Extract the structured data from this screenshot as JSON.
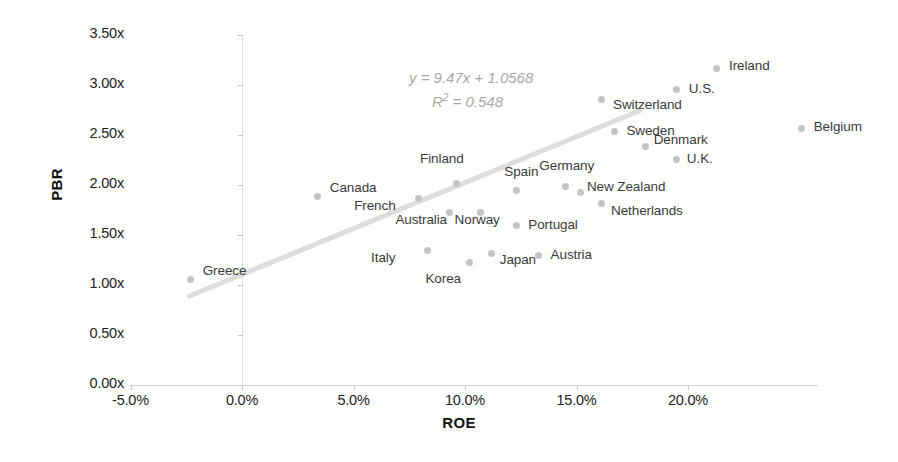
{
  "chart_data": {
    "type": "scatter",
    "title": "",
    "xlabel": "ROE",
    "ylabel": "PBR",
    "xlim": [
      -5.0,
      20.0
    ],
    "ylim": [
      0.0,
      3.5
    ],
    "x_tick_labels": [
      "-5.0%",
      "0.0%",
      "5.0%",
      "10.0%",
      "15.0%",
      "20.0%"
    ],
    "x_ticks": [
      -5.0,
      0.0,
      5.0,
      10.0,
      15.0,
      20.0
    ],
    "y_tick_labels": [
      "0.00x",
      "0.50x",
      "1.00x",
      "1.50x",
      "2.00x",
      "2.50x",
      "3.00x",
      "3.50x"
    ],
    "y_ticks": [
      0.0,
      0.5,
      1.0,
      1.5,
      2.0,
      2.5,
      3.0,
      3.5
    ],
    "grid": false,
    "legend": "none",
    "marker_color": "#c4c4c4",
    "trendline_color": "#dcdcdc",
    "annotations": {
      "equation": "y = 9.47x + 1.0568",
      "r_squared_prefix": "R",
      "r_squared_sup": "2",
      "r_squared_value": " = 0.548",
      "color": "#a8a8a8"
    },
    "trendline": {
      "x_start": -2.35,
      "y_start": 0.89,
      "x_end": 17.8,
      "y_end": 2.74
    },
    "points": [
      {
        "label": "Greece",
        "x": -2.3,
        "y": 1.06,
        "label_dx": 12,
        "label_dy": -8
      },
      {
        "label": "Canada",
        "x": 3.4,
        "y": 1.89,
        "label_dx": 12,
        "label_dy": -8
      },
      {
        "label": "French",
        "x": 7.9,
        "y": 1.87,
        "label_dx": -64,
        "label_dy": 8
      },
      {
        "label": "Finland",
        "x": 9.6,
        "y": 2.02,
        "label_dx": -36,
        "label_dy": -24
      },
      {
        "label": "Australia",
        "x": 9.3,
        "y": 1.73,
        "label_dx": -54,
        "label_dy": 8
      },
      {
        "label": "Italy",
        "x": 8.3,
        "y": 1.35,
        "label_dx": -56,
        "label_dy": 8
      },
      {
        "label": "Korea",
        "x": 10.2,
        "y": 1.23,
        "label_dx": -44,
        "label_dy": 17
      },
      {
        "label": "Norway",
        "x": 10.7,
        "y": 1.73,
        "label_dx": -26,
        "label_dy": 8
      },
      {
        "label": "Japan",
        "x": 11.2,
        "y": 1.32,
        "label_dx": 8,
        "label_dy": 7
      },
      {
        "label": "Spain",
        "x": 12.3,
        "y": 1.95,
        "label_dx": -12,
        "label_dy": -18
      },
      {
        "label": "Portugal",
        "x": 12.3,
        "y": 1.6,
        "label_dx": 12,
        "label_dy": 0
      },
      {
        "label": "Austria",
        "x": 13.3,
        "y": 1.3,
        "label_dx": 12,
        "label_dy": 0
      },
      {
        "label": "Germany",
        "x": 14.5,
        "y": 1.99,
        "label_dx": -26,
        "label_dy": -20
      },
      {
        "label": "New Zealand",
        "x": 15.2,
        "y": 1.93,
        "label_dx": 6,
        "label_dy": -5
      },
      {
        "label": "Netherlands",
        "x": 16.1,
        "y": 1.82,
        "label_dx": 10,
        "label_dy": 8
      },
      {
        "label": "Switzerland",
        "x": 16.1,
        "y": 2.86,
        "label_dx": 12,
        "label_dy": 6
      },
      {
        "label": "Sweden",
        "x": 16.7,
        "y": 2.54,
        "label_dx": 12,
        "label_dy": 0
      },
      {
        "label": "Denmark",
        "x": 18.1,
        "y": 2.39,
        "label_dx": 8,
        "label_dy": -6
      },
      {
        "label": "U.K.",
        "x": 19.5,
        "y": 2.26,
        "label_dx": 10,
        "label_dy": 0
      },
      {
        "label": "U.S.",
        "x": 19.5,
        "y": 2.96,
        "label_dx": 12,
        "label_dy": 0
      },
      {
        "label": "Ireland",
        "x": 21.3,
        "y": 3.17,
        "label_dx": 12,
        "label_dy": -2
      },
      {
        "label": "Belgium",
        "x": 25.1,
        "y": 2.57,
        "label_dx": 12,
        "label_dy": -1
      }
    ]
  }
}
